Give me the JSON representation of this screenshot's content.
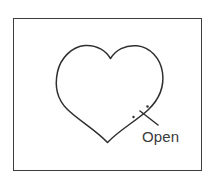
{
  "figure": {
    "type": "line-drawing-diagram",
    "title": "",
    "background_color": "#ffffff",
    "frame": {
      "name": "outer-border-rectangle",
      "stroke_color": "#3d3d3f",
      "stroke_width": 1.4,
      "x": 13,
      "y": 18,
      "width": 189,
      "height": 153
    },
    "shapes": [
      {
        "name": "heart-outline",
        "kind": "heart",
        "stroke_color": "#2f2f31",
        "stroke_width": 1.5,
        "fill": "none",
        "bounds": {
          "x": 57,
          "y": 45,
          "width": 106,
          "height": 98
        },
        "cusp": {
          "x": 110,
          "y": 58
        },
        "bottom_tip": {
          "x": 107,
          "y": 142
        }
      },
      {
        "name": "x-mark-stroke",
        "kind": "line",
        "stroke_color": "#2f2f31",
        "stroke_width": 1.5,
        "from": {
          "x": 140,
          "y": 111
        },
        "to": {
          "x": 158,
          "y": 125
        }
      },
      {
        "name": "annotation-dot-upper",
        "kind": "dot",
        "color": "#2f2f31",
        "x": 147.5,
        "y": 106.5,
        "radius": 1.2
      },
      {
        "name": "annotation-dot-lower",
        "kind": "dot",
        "color": "#2f2f31",
        "x": 133.5,
        "y": 117,
        "radius": 1.2
      }
    ],
    "annotations": [
      {
        "name": "open-label",
        "text": "Open",
        "x": 142,
        "y": 128,
        "font_size": 15,
        "color": "#3a3a3c"
      }
    ]
  }
}
